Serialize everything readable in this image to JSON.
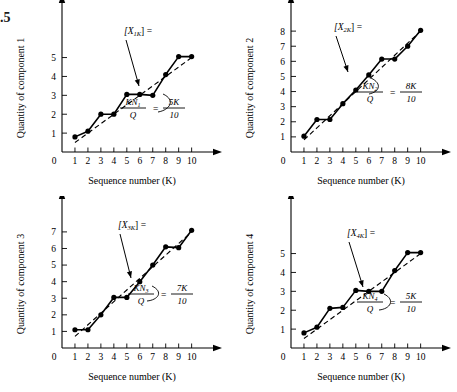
{
  "figure": {
    "number_fragment": ".5",
    "panel_count": 4
  },
  "charts": [
    {
      "id": "panel-1",
      "ylabel": "Quantity of component 1",
      "xlabel": "Sequence number (K)",
      "origin_label": "0",
      "series_label": "[X",
      "series_label_sub": "1K",
      "series_label_tail": "] =",
      "formula_numerator": "KN",
      "formula_numerator_sub": "1",
      "formula_denominator": "Q",
      "formula_equals": "=",
      "formula_rhs_numerator": "5K",
      "formula_rhs_denominator": "10",
      "x_ticks": [
        "1",
        "2",
        "3",
        "4",
        "5",
        "6",
        "7",
        "8",
        "9",
        "10"
      ],
      "y_ticks": [
        "1",
        "2",
        "3",
        "4",
        "5"
      ],
      "chart_data": {
        "type": "line",
        "title": "Quantity of component 1",
        "xlabel": "Sequence number (K)",
        "ylabel": "Quantity of component 1",
        "xlim": [
          0,
          10.8
        ],
        "ylim": [
          0,
          7.2
        ],
        "grid": false,
        "legend": "none",
        "x": [
          1,
          2,
          3,
          4,
          5,
          6,
          7,
          8,
          9,
          10
        ],
        "series": [
          {
            "name": "[X1K] =",
            "style": "solid-markers",
            "values": [
              0.8,
              1.1,
              2.0,
              2.0,
              3.05,
              3.05,
              3.0,
              4.1,
              5.05,
              5.05
            ]
          },
          {
            "name": "KN1/Q = 5K/10",
            "style": "dashed",
            "values": [
              0.5,
              1.0,
              1.5,
              2.0,
              2.5,
              3.0,
              3.5,
              4.0,
              4.5,
              5.0
            ]
          }
        ]
      }
    },
    {
      "id": "panel-2",
      "ylabel": "Quantity of component 2",
      "xlabel": "Sequence number (K)",
      "origin_label": "0",
      "series_label": "[X",
      "series_label_sub": "2K",
      "series_label_tail": "] =",
      "formula_numerator": "KN",
      "formula_numerator_sub": "2",
      "formula_denominator": "Q",
      "formula_equals": "=",
      "formula_rhs_numerator": "8K",
      "formula_rhs_denominator": "10",
      "x_ticks": [
        "1",
        "2",
        "3",
        "4",
        "5",
        "6",
        "7",
        "8",
        "9",
        "10"
      ],
      "y_ticks": [
        "1",
        "2",
        "3",
        "4",
        "5",
        "6",
        "7",
        "8"
      ],
      "chart_data": {
        "type": "line",
        "title": "Quantity of component 2",
        "xlabel": "Sequence number (K)",
        "ylabel": "Quantity of component 2",
        "xlim": [
          0,
          10.8
        ],
        "ylim": [
          0,
          9.0
        ],
        "grid": false,
        "legend": "none",
        "x": [
          1,
          2,
          3,
          4,
          5,
          6,
          7,
          8,
          9,
          10
        ],
        "series": [
          {
            "name": "[X2K] =",
            "style": "solid-markers",
            "values": [
              1.05,
              2.15,
              2.15,
              3.2,
              4.1,
              5.1,
              6.15,
              6.15,
              7.0,
              8.05
            ]
          },
          {
            "name": "KN2/Q = 8K/10",
            "style": "dashed",
            "values": [
              0.8,
              1.6,
              2.4,
              3.2,
              4.0,
              4.8,
              5.6,
              6.4,
              7.2,
              8.0
            ]
          }
        ]
      }
    },
    {
      "id": "panel-3",
      "ylabel": "Quantity of component 3",
      "xlabel": "Sequence number (K)",
      "origin_label": "0",
      "series_label": "[X",
      "series_label_sub": "3K",
      "series_label_tail": "] =",
      "formula_numerator": "KN",
      "formula_numerator_sub": "3",
      "formula_denominator": "Q",
      "formula_equals": "=",
      "formula_rhs_numerator": "7K",
      "formula_rhs_denominator": "10",
      "x_ticks": [
        "1",
        "2",
        "3",
        "4",
        "5",
        "6",
        "7",
        "8",
        "9",
        "10"
      ],
      "y_ticks": [
        "1",
        "2",
        "3",
        "4",
        "5",
        "6",
        "7"
      ],
      "chart_data": {
        "type": "line",
        "title": "Quantity of component 3",
        "xlabel": "Sequence number (K)",
        "ylabel": "Quantity of component 3",
        "xlim": [
          0,
          10.8
        ],
        "ylim": [
          0,
          8.2
        ],
        "grid": false,
        "legend": "none",
        "x": [
          1,
          2,
          3,
          4,
          5,
          6,
          7,
          8,
          9,
          10
        ],
        "series": [
          {
            "name": "[X3K] =",
            "style": "solid-markers",
            "values": [
              1.1,
              1.1,
              2.0,
              3.05,
              3.05,
              4.0,
              5.0,
              6.1,
              6.05,
              7.1
            ]
          },
          {
            "name": "KN3/Q = 7K/10",
            "style": "dashed",
            "values": [
              0.7,
              1.4,
              2.1,
              2.8,
              3.5,
              4.2,
              4.9,
              5.6,
              6.3,
              7.0
            ]
          }
        ]
      }
    },
    {
      "id": "panel-4",
      "ylabel": "Quantity of component 4",
      "xlabel": "Sequence number (K)",
      "origin_label": "0",
      "series_label": "[X",
      "series_label_sub": "4K",
      "series_label_tail": "] =",
      "formula_numerator": "KN",
      "formula_numerator_sub": "4",
      "formula_denominator": "Q",
      "formula_equals": "=",
      "formula_rhs_numerator": "5K",
      "formula_rhs_denominator": "10",
      "x_ticks": [
        "1",
        "2",
        "3",
        "4",
        "5",
        "6",
        "7",
        "8",
        "9",
        "10"
      ],
      "y_ticks": [
        "1",
        "2",
        "3",
        "4",
        "5"
      ],
      "chart_data": {
        "type": "line",
        "title": "Quantity of component 4",
        "xlabel": "Sequence number (K)",
        "ylabel": "Quantity of component 4",
        "xlim": [
          0,
          10.8
        ],
        "ylim": [
          0,
          7.2
        ],
        "grid": false,
        "legend": "none",
        "x": [
          1,
          2,
          3,
          4,
          5,
          6,
          7,
          8,
          9,
          10
        ],
        "series": [
          {
            "name": "[X4K] =",
            "style": "solid-markers",
            "values": [
              0.8,
              1.1,
              2.1,
              2.15,
              3.05,
              3.0,
              3.0,
              4.1,
              5.05,
              5.05
            ]
          },
          {
            "name": "KN4/Q = 5K/10",
            "style": "dashed",
            "values": [
              0.5,
              1.0,
              1.5,
              2.0,
              2.5,
              3.0,
              3.5,
              4.0,
              4.5,
              5.0
            ]
          }
        ]
      }
    }
  ],
  "colors": {
    "line": "#000000",
    "marker": "#000000",
    "axis": "#000000",
    "background": "#ffffff"
  }
}
